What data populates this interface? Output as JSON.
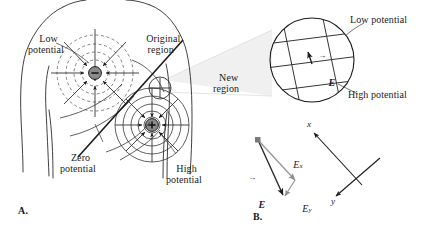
{
  "figure": {
    "colors": {
      "ink": "#1a1a1a",
      "line": "#333333",
      "dashed": "#555555",
      "charge_fill": "#8a8a8a",
      "cone_fill": "#ededed",
      "vector_light": "#999999",
      "background": "#ffffff"
    }
  },
  "panel_a": {
    "label": "A.",
    "labels": {
      "low_potential": "Low\npotential",
      "original_region": "Original\nregion",
      "zero_potential": "Zero\npotential",
      "high_potential": "High\npotential"
    },
    "charges": [
      {
        "name": "negative-charge",
        "sign": "−",
        "cx": 95,
        "cy": 73
      },
      {
        "name": "positive-charge",
        "sign": "+",
        "cx": 152,
        "cy": 125
      }
    ],
    "original_region": {
      "cx": 160,
      "cy": 88,
      "r": 11
    }
  },
  "magnifier": {
    "label_new_region": "New\nregion",
    "circle": {
      "cx": 312,
      "cy": 60,
      "r": 42
    },
    "labels": {
      "low_potential": "Low potential",
      "high_potential": "High potential",
      "field_vector": "E"
    }
  },
  "panel_b": {
    "label": "B.",
    "vector_labels": {
      "resultant": "E",
      "x_component": "E",
      "x_subscript": "x",
      "y_component": "E",
      "y_subscript": "y"
    },
    "axis_labels": {
      "x_axis": "x",
      "y_axis": "y"
    }
  }
}
